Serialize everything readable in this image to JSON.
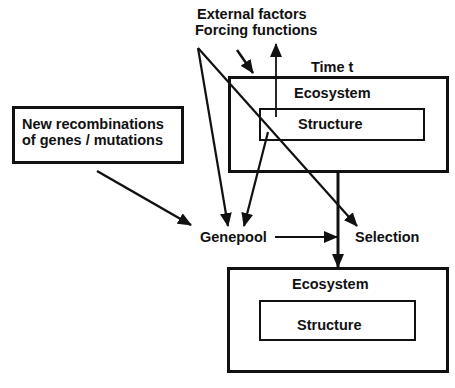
{
  "diagram": {
    "external": {
      "line1": "External factors",
      "line2": "Forcing functions"
    },
    "time_label": "Time t",
    "top_ecosystem": {
      "title": "Ecosystem",
      "inner": "Structure"
    },
    "recombination_box": {
      "line1": "New recombinations",
      "line2": "of genes / mutations"
    },
    "genepool": "Genepool",
    "selection": "Selection",
    "bottom_ecosystem": {
      "title": "Ecosystem",
      "inner": "Structure"
    },
    "colors": {
      "ink": "#111111",
      "background": "#ffffff"
    }
  }
}
